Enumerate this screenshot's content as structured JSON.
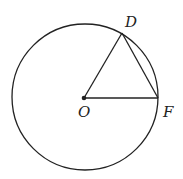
{
  "diagram": {
    "type": "circle-geometry",
    "circle": {
      "center": "O",
      "cx": 85,
      "cy": 97,
      "r": 73
    },
    "points": [
      {
        "id": "O",
        "label": "O",
        "x": 84,
        "y": 98
      },
      {
        "id": "D",
        "label": "D",
        "x": 122,
        "y": 33
      },
      {
        "id": "F",
        "label": "F",
        "x": 158,
        "y": 98
      }
    ],
    "segments": [
      [
        "O",
        "D"
      ],
      [
        "O",
        "F"
      ],
      [
        "D",
        "F"
      ]
    ],
    "labels": {
      "O": "O",
      "D": "D",
      "F": "F"
    },
    "colors": {
      "stroke": "#222222",
      "background": "#ffffff"
    }
  }
}
